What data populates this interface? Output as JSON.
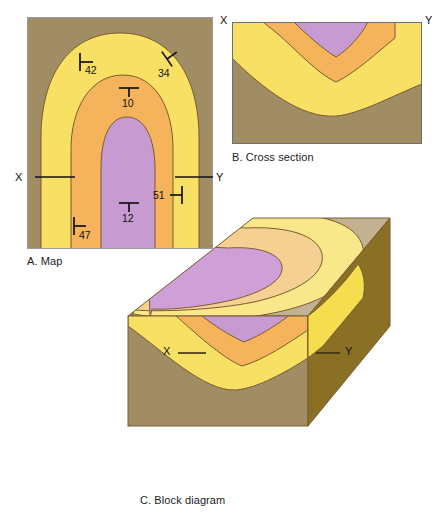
{
  "figure": {
    "colors": {
      "youngest_unit_brown": "#a08d63",
      "dark_brown_side": "#8a7024",
      "yellow_unit": "#f7e063",
      "orange_unit": "#f5b45c",
      "purple_core_unit": "#c89ad2",
      "top_surface_yellow": "#f8e88a",
      "top_surface_orange": "#f6cf93",
      "top_surface_purple": "#cfa0d8",
      "top_surface_brown": "#c3b292",
      "outline": "#7a5c2e",
      "text": "#111111",
      "background": "#ffffff"
    }
  },
  "panels": [
    {
      "id": "map",
      "caption": "A. Map",
      "section_line": {
        "left_label": "X",
        "right_label": "Y"
      },
      "strike_dip_symbols": [
        {
          "id": "sd-42",
          "value": "42",
          "type": "strike-dip-inclined"
        },
        {
          "id": "sd-34",
          "value": "34",
          "type": "strike-dip-inclined"
        },
        {
          "id": "sd-10",
          "value": "10",
          "type": "strike-dip-inclined"
        },
        {
          "id": "sd-12",
          "value": "12",
          "type": "strike-dip-inclined"
        },
        {
          "id": "sd-47",
          "value": "47",
          "type": "strike-dip-inclined"
        },
        {
          "id": "sd-51",
          "value": "51",
          "type": "strike-dip-inclined"
        }
      ]
    },
    {
      "id": "cross-section",
      "caption": "B. Cross section",
      "section_line": {
        "left_label": "X",
        "right_label": "Y"
      }
    },
    {
      "id": "block-diagram",
      "caption": "C. Block diagram",
      "section_line": {
        "left_label": "X",
        "right_label": "Y"
      }
    }
  ]
}
